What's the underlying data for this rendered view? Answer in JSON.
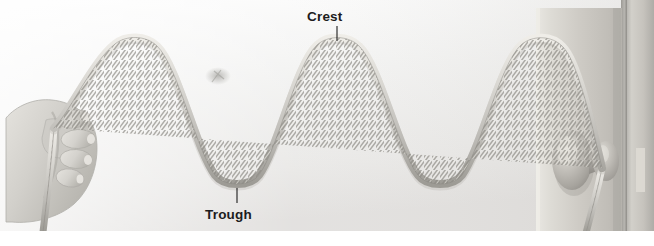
{
  "figure": {
    "width": 654,
    "height": 246,
    "background_color": "#ffffff"
  },
  "annotations": {
    "crest": {
      "label": "Crest",
      "text_x": 307,
      "text_y": 10,
      "leader_from": [
        337,
        26
      ],
      "leader_to": [
        337,
        41
      ],
      "color": "#1c1c1c"
    },
    "trough": {
      "label": "Trough",
      "text_x": 205,
      "text_y": 208,
      "leader_from": [
        237,
        203
      ],
      "leader_to": [
        237,
        188
      ],
      "color": "#1c1c1c"
    }
  },
  "scene": {
    "backdrop": {
      "name": "wall-backdrop",
      "top_color": "#f4f4f4",
      "bottom_color": "#e3e3e2",
      "left": 0,
      "top": 0,
      "width": 654,
      "height": 231
    },
    "door": {
      "name": "door-panel",
      "left": 536,
      "top": 8,
      "width": 86,
      "height": 223,
      "face_color": "#cfcdc8",
      "highlight_color": "#e8e6e1",
      "shadow_color": "#b2b0ab"
    },
    "door_jamb": {
      "name": "door-jamb",
      "left": 626,
      "top": 0,
      "width": 28,
      "height": 231,
      "color": "#c9c7c2"
    },
    "door_gap": {
      "name": "door-gap",
      "left": 621,
      "top": 0,
      "width": 6,
      "height": 231,
      "color": "#a9a7a2"
    },
    "strike_plate": {
      "name": "strike-plate",
      "left": 636,
      "top": 148,
      "width": 9,
      "height": 44,
      "color": "#ddd9d3"
    },
    "doorknob": {
      "name": "doorknob",
      "rosette_cx": 572,
      "rosette_cy": 160,
      "rosette_rx": 20,
      "rosette_ry": 30,
      "knob_cx": 605,
      "knob_cy": 161,
      "knob_rx": 13,
      "knob_ry": 20,
      "neck_color": "#a8a6a1",
      "body_color": "#b8b6b1",
      "highlight_color": "#e0ded8"
    },
    "hand": {
      "name": "hand-gripping-rope",
      "left": 6,
      "top": 96,
      "width": 104,
      "height": 128,
      "skin_color": "#d6d4cf",
      "shade_color": "#bab8b3",
      "fingers": 4
    },
    "smudge": {
      "name": "background-smudge",
      "cx": 218,
      "cy": 76,
      "color": "#b9b8b5"
    }
  },
  "rope": {
    "name": "rope-wave",
    "color_light": "#e6e4df",
    "color_mid": "#c5c3be",
    "color_dark": "#97958f",
    "outline_color": "#8f8d87",
    "thickness": 7,
    "twist_pitch": 8,
    "anchor_hand": [
      54,
      128
    ],
    "anchor_knob": [
      602,
      168
    ],
    "tail_end": [
      43,
      232
    ],
    "knob_tail_end": [
      586,
      233
    ]
  },
  "chart_data": {
    "type": "line",
    "xlabel": "",
    "ylabel": "",
    "wave": {
      "baseline_y": 113,
      "amplitude": 75,
      "wavelength": 202,
      "crest_y": 38,
      "trough_y": 188,
      "x_start": 54,
      "x_end": 602
    },
    "crests": [
      {
        "index": 1,
        "x": 135,
        "y": 38,
        "labeled": false
      },
      {
        "index": 2,
        "x": 337,
        "y": 38,
        "labeled": true
      },
      {
        "index": 3,
        "x": 542,
        "y": 38,
        "labeled": false
      }
    ],
    "troughs": [
      {
        "index": 1,
        "x": 237,
        "y": 188,
        "labeled": true
      },
      {
        "index": 2,
        "x": 440,
        "y": 188,
        "labeled": false
      }
    ],
    "legend": [
      "Crest",
      "Trough"
    ],
    "grid": false
  }
}
